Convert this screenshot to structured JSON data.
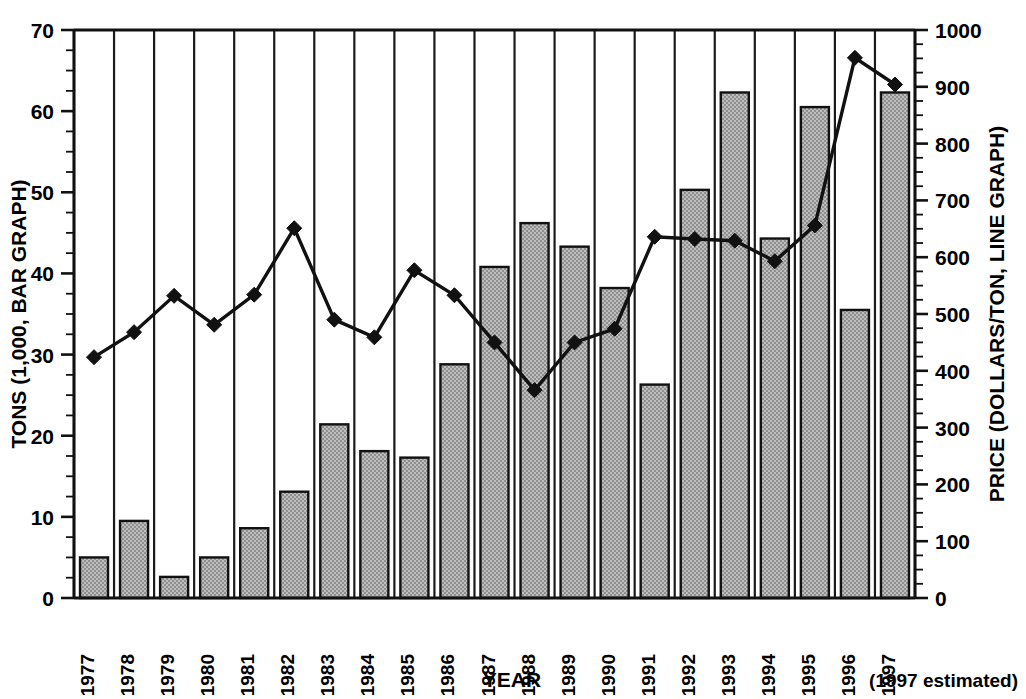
{
  "chart_data": {
    "type": "bar",
    "title": "",
    "subtitle": "",
    "xlabel": "YEAR",
    "ylabel": "TONS (1,000, BAR GRAPH)",
    "y2label": "PRICE (DOLLARS/TON, LINE GRAPH)",
    "categories": [
      "1977",
      "1978",
      "1979",
      "1980",
      "1981",
      "1982",
      "1983",
      "1984",
      "1985",
      "1986",
      "1987",
      "1988",
      "1989",
      "1990",
      "1991",
      "1992",
      "1993",
      "1994",
      "1995",
      "1996",
      "1997"
    ],
    "series": [
      {
        "name": "TONS (1,000, BAR GRAPH)",
        "render": "bar",
        "axis": "left",
        "values": [
          5.0,
          9.5,
          2.6,
          5.0,
          8.6,
          13.1,
          21.4,
          18.1,
          17.3,
          28.8,
          40.8,
          46.2,
          43.3,
          38.2,
          26.3,
          50.3,
          62.3,
          44.3,
          60.5,
          35.5,
          62.3
        ]
      },
      {
        "name": "PRICE (DOLLARS/TON, LINE GRAPH)",
        "render": "line",
        "axis": "right",
        "values": [
          424,
          468,
          532,
          481,
          534,
          651,
          490,
          459,
          577,
          533,
          450,
          366,
          450,
          474,
          636,
          632,
          629,
          593,
          656,
          951,
          904
        ]
      }
    ],
    "ylim": [
      0,
      70
    ],
    "y2lim": [
      0,
      1000
    ],
    "yticks": [
      0,
      10,
      20,
      30,
      40,
      50,
      60,
      70
    ],
    "y2ticks": [
      0,
      100,
      200,
      300,
      400,
      500,
      600,
      700,
      800,
      900,
      1000
    ],
    "yminor_step": 2.5,
    "y2minor_step": 25,
    "grid": "vertical-category-separators",
    "legend": "none",
    "annotations": [
      "(1997 estimated)"
    ],
    "colors": {
      "bar_fill": "#a9a9a9",
      "bar_stroke": "#111111",
      "line_stroke": "#111111",
      "marker_fill": "#111111",
      "axis": "#111111",
      "background": "#ffffff"
    }
  },
  "footnote": "(1997 estimated)"
}
